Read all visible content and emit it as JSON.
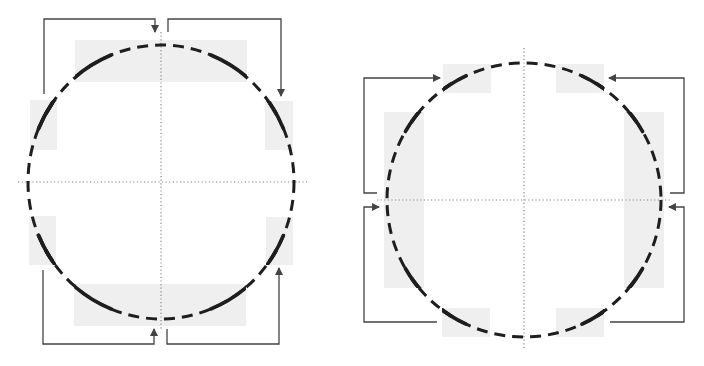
{
  "figure": {
    "width": 704,
    "height": 366,
    "colors": {
      "background": "#ffffff",
      "shade": "#efefef",
      "arc": "#1e1e1e",
      "arrow": "#444444",
      "axis": "#888888"
    },
    "panels": [
      {
        "id": "left",
        "description": "circle boundary split into 4 orthogonal segments; arrows map top-left/top-right and bottom-left/bottom-right regions",
        "center": [
          161,
          182
        ],
        "radius": [
          133,
          137
        ],
        "axes": {
          "vertical": {
            "x": 161,
            "y1": 32,
            "y2": 330
          },
          "horizontal": {
            "y": 182,
            "x1": 18,
            "x2": 307
          }
        },
        "shaded_regions": [
          {
            "name": "top",
            "x": 75,
            "y": 40,
            "w": 172,
            "h": 42
          },
          {
            "name": "bottom",
            "x": 74,
            "y": 284,
            "w": 172,
            "h": 42
          },
          {
            "name": "left-upper",
            "x": 30,
            "y": 100,
            "w": 27,
            "h": 50
          },
          {
            "name": "left-lower",
            "x": 29,
            "y": 216,
            "w": 27,
            "h": 49
          },
          {
            "name": "right-upper",
            "x": 265,
            "y": 101,
            "w": 28,
            "h": 49
          },
          {
            "name": "right-lower",
            "x": 266,
            "y": 217,
            "w": 27,
            "h": 48
          }
        ],
        "arrows": [
          {
            "name": "left-upper-to-top",
            "points": [
              [
                44,
                94
              ],
              [
                44,
                19
              ],
              [
                155,
                19
              ],
              [
                155,
                32
              ]
            ]
          },
          {
            "name": "top-to-right-upper",
            "points": [
              [
                168,
                32
              ],
              [
                168,
                19
              ],
              [
                281,
                19
              ],
              [
                281,
                96
              ]
            ]
          },
          {
            "name": "left-lower-to-bottom",
            "points": [
              [
                43,
                270
              ],
              [
                43,
                344
              ],
              [
                154,
                344
              ],
              [
                154,
                329
              ]
            ]
          },
          {
            "name": "bottom-to-right-lower",
            "points": [
              [
                167,
                329
              ],
              [
                167,
                344
              ],
              [
                279,
                344
              ],
              [
                279,
                268
              ]
            ]
          }
        ]
      },
      {
        "id": "right",
        "description": "circle boundary split into 4 orthogonal segments; arrows map side regions to top/bottom corners",
        "center": [
          524,
          200
        ],
        "radius": [
          137,
          137
        ],
        "axes": {
          "vertical": {
            "x": 524,
            "y1": 48,
            "y2": 348
          },
          "horizontal": {
            "y": 200,
            "x1": 377,
            "x2": 670
          }
        },
        "shaded_regions": [
          {
            "name": "top-left",
            "x": 443,
            "y": 64,
            "w": 48,
            "h": 29
          },
          {
            "name": "top-right",
            "x": 556,
            "y": 64,
            "w": 48,
            "h": 29
          },
          {
            "name": "bottom-left",
            "x": 442,
            "y": 308,
            "w": 48,
            "h": 29
          },
          {
            "name": "bottom-right",
            "x": 556,
            "y": 308,
            "w": 48,
            "h": 29
          },
          {
            "name": "left-side",
            "x": 384,
            "y": 112,
            "w": 40,
            "h": 176
          },
          {
            "name": "right-side",
            "x": 624,
            "y": 112,
            "w": 40,
            "h": 176
          }
        ],
        "arrows": [
          {
            "name": "left-side-to-top-left",
            "points": [
              [
                377,
                193
              ],
              [
                364,
                193
              ],
              [
                364,
                78
              ],
              [
                440,
                78
              ]
            ]
          },
          {
            "name": "bottom-left-to-left-side",
            "points": [
              [
                437,
                322
              ],
              [
                364,
                322
              ],
              [
                364,
                207
              ],
              [
                379,
                207
              ]
            ]
          },
          {
            "name": "right-side-to-top-right",
            "points": [
              [
                670,
                193
              ],
              [
                684,
                193
              ],
              [
                684,
                78
              ],
              [
                609,
                78
              ]
            ]
          },
          {
            "name": "bottom-right-to-right-side",
            "points": [
              [
                610,
                322
              ],
              [
                684,
                322
              ],
              [
                684,
                207
              ],
              [
                669,
                207
              ]
            ]
          }
        ]
      }
    ]
  }
}
